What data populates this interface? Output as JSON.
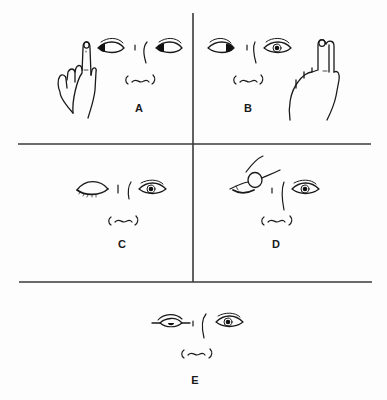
{
  "figure": {
    "type": "medical-line-drawing",
    "colors": {
      "ink": "#1a1a1a",
      "divider": "#3a3a3a",
      "background": "#fdfdfd"
    },
    "layout": {
      "grid": "2x2 panels above one full-width panel",
      "vertical_divider_x": 193,
      "horizontal_divider_y": [
        144,
        282
      ]
    }
  },
  "panels": [
    {
      "id": "A",
      "label": "A",
      "description": "Finger held up to the patient's right; both eyes look toward the finger",
      "gaze": "left"
    },
    {
      "id": "B",
      "label": "B",
      "description": "Finger held up to the patient's left; right eye turns toward it, left eye looks centre",
      "gaze": "right"
    },
    {
      "id": "C",
      "label": "C",
      "description": "Right eye closed, left eye open looking forward",
      "gaze": "center"
    },
    {
      "id": "D",
      "label": "D",
      "description": "Examiner's thumb pressing/holding the right eyelid; left eye open",
      "gaze": "center"
    },
    {
      "id": "E",
      "label": "E",
      "description": "Right eye half-lidded (ptosis) with pupil partly covered; left eye open",
      "gaze": "center"
    }
  ]
}
